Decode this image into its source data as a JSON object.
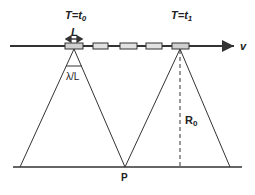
{
  "diagram": {
    "title_left": "T=t",
    "title_left_sub": "0",
    "title_right": "T=t",
    "title_right_sub": "1",
    "antenna_length_label": "L",
    "beamwidth_label": "λ/L",
    "range_label": "R",
    "range_label_sub": "0",
    "target_label": "P",
    "velocity_label": "v",
    "colors": {
      "stroke": "#333333",
      "box_fill": "#d8d8d8",
      "background": "#ffffff"
    },
    "antenna_positions_x": [
      74,
      100,
      128,
      154,
      180
    ]
  }
}
